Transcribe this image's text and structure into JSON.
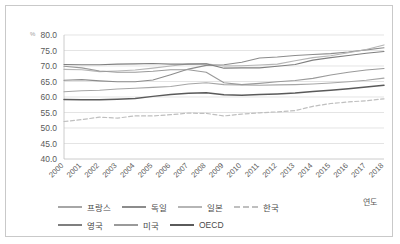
{
  "chart_data": {
    "type": "line",
    "title": "",
    "unit_label": "%",
    "xlabel": "연도",
    "ylabel": "",
    "ylim": [
      40.0,
      80.0
    ],
    "ytick_step": 5.0,
    "ytick_labels": [
      "80.0",
      "75.0",
      "70.0",
      "65.0",
      "60.0",
      "55.0",
      "50.0",
      "45.0",
      "40.0"
    ],
    "grid": true,
    "legend_position": "bottom",
    "categories": [
      "2000",
      "2001",
      "2002",
      "2003",
      "2004",
      "2005",
      "2006",
      "2007",
      "2008",
      "2009",
      "2010",
      "2011",
      "2012",
      "2013",
      "2014",
      "2015",
      "2016",
      "2017",
      "2018"
    ],
    "series": [
      {
        "name": "프랑스",
        "color": "#a6a6a6",
        "dash": "none",
        "width": 1.1,
        "values": [
          61.7,
          62.0,
          62.2,
          62.6,
          62.8,
          63.1,
          63.4,
          64.2,
          64.6,
          64.0,
          63.9,
          63.8,
          63.9,
          64.0,
          64.2,
          64.5,
          64.9,
          65.4,
          66.1
        ]
      },
      {
        "name": "독일",
        "color": "#8c8c8c",
        "dash": "none",
        "width": 1.1,
        "values": [
          65.4,
          65.6,
          65.2,
          64.9,
          64.9,
          65.5,
          67.2,
          69.0,
          70.2,
          70.4,
          71.2,
          72.6,
          72.9,
          73.4,
          73.7,
          74.0,
          74.5,
          75.2,
          75.9
        ]
      },
      {
        "name": "일본",
        "color": "#b5b5b5",
        "dash": "none",
        "width": 1.1,
        "values": [
          68.9,
          68.8,
          68.2,
          68.4,
          68.7,
          69.3,
          70.0,
          70.7,
          70.7,
          70.0,
          70.1,
          70.3,
          70.6,
          71.7,
          72.7,
          73.3,
          74.3,
          75.3,
          76.8
        ]
      },
      {
        "name": "한국",
        "color": "#bfbfbf",
        "dash": "4,2.5",
        "width": 1.2,
        "values": [
          52.1,
          52.7,
          53.5,
          53.2,
          53.9,
          53.9,
          54.3,
          54.8,
          54.7,
          53.9,
          54.5,
          54.9,
          55.2,
          55.6,
          57.0,
          57.9,
          58.4,
          58.8,
          59.4
        ]
      },
      {
        "name": "영국",
        "color": "#7f7f7f",
        "dash": "none",
        "width": 1.1,
        "values": [
          70.5,
          70.4,
          70.4,
          70.6,
          70.7,
          70.8,
          70.6,
          70.6,
          70.7,
          69.3,
          69.4,
          69.4,
          69.9,
          70.5,
          71.9,
          72.7,
          73.4,
          74.1,
          74.7
        ]
      },
      {
        "name": "미국",
        "color": "#9a9a9a",
        "dash": "none",
        "width": 1.1,
        "values": [
          69.9,
          69.4,
          68.4,
          68.0,
          68.0,
          68.3,
          68.8,
          68.8,
          68.0,
          64.6,
          64.0,
          64.4,
          64.9,
          65.3,
          66.0,
          67.1,
          68.0,
          68.7,
          69.2
        ]
      },
      {
        "name": "OECD",
        "color": "#5a5a5a",
        "dash": "none",
        "width": 1.5,
        "values": [
          59.2,
          59.1,
          59.1,
          59.3,
          59.5,
          60.2,
          60.8,
          61.2,
          61.4,
          60.7,
          60.6,
          60.8,
          61.0,
          61.3,
          61.8,
          62.2,
          62.7,
          63.2,
          63.8
        ]
      }
    ]
  },
  "legend": {
    "row1": [
      {
        "label": "프랑스",
        "color": "#a6a6a6",
        "dashed": false
      },
      {
        "label": "독일",
        "color": "#8c8c8c",
        "dashed": false
      },
      {
        "label": "일본",
        "color": "#b5b5b5",
        "dashed": false
      },
      {
        "label": "한국",
        "color": "#bfbfbf",
        "dashed": true
      }
    ],
    "row2": [
      {
        "label": "영국",
        "color": "#7f7f7f",
        "dashed": false
      },
      {
        "label": "미국",
        "color": "#9a9a9a",
        "dashed": false
      },
      {
        "label": "OECD",
        "color": "#5a5a5a",
        "dashed": false
      }
    ]
  }
}
